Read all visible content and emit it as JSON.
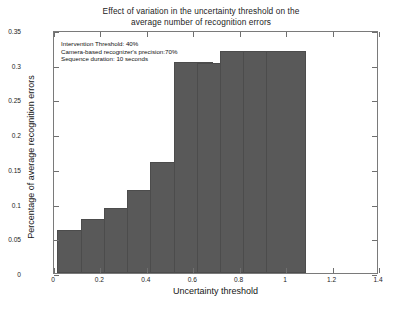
{
  "chart_data": {
    "type": "bar",
    "title": "Effect of variation in the uncertainty threshold on the average number of recognition errors",
    "title_line1": "Effect of variation in the uncertainty threshold on the",
    "title_line2": "average number of recognition errors",
    "xlabel": "Uncertainty threshold",
    "ylabel": "Percentage of average recognition errors",
    "x": [
      0.1,
      0.2,
      0.3,
      0.4,
      0.5,
      0.6,
      0.7,
      0.8,
      0.9,
      1.0
    ],
    "values": [
      0.062,
      0.078,
      0.094,
      0.12,
      0.16,
      0.304,
      0.302,
      0.32,
      0.32,
      0.32
    ],
    "categories": [
      "0.1",
      "0.2",
      "0.3",
      "0.4",
      "0.5",
      "0.6",
      "0.7",
      "0.8",
      "0.9",
      "1"
    ],
    "xlim": [
      0,
      1.4
    ],
    "ylim": [
      0,
      0.35
    ],
    "xticks": [
      0,
      0.2,
      0.4,
      0.6,
      0.8,
      1,
      1.2,
      1.4
    ],
    "xtick_labels": [
      "0",
      "0.2",
      "0.4",
      "0.6",
      "0.8",
      "1",
      "1.2",
      "1.4"
    ],
    "yticks": [
      0,
      0.05,
      0.1,
      0.15,
      0.2,
      0.25,
      0.3,
      0.35
    ],
    "ytick_labels": [
      "0",
      "0.05",
      "0.1",
      "0.15",
      "0.2",
      "0.25",
      "0.3",
      "0.35"
    ],
    "bar_width": 0.085,
    "grid": false,
    "legend": null,
    "bar_color": "#595959",
    "annotations": [
      "Intervention Threshold: 40%",
      "Camera-based recognizer's precision:70%",
      "Sequence duration: 10 seconds"
    ]
  }
}
